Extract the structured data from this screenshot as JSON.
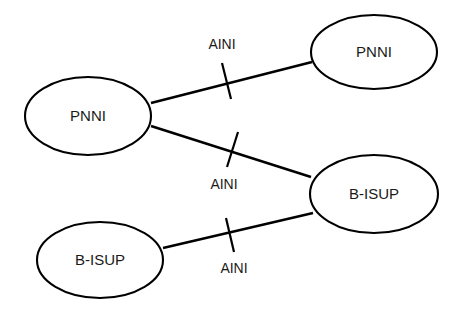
{
  "diagram": {
    "background_color": "#ffffff",
    "line_color": "#000000",
    "text_color": "#1a1a1a",
    "nodes": [
      {
        "id": "pnni-left",
        "label": "PNNI",
        "cx": 88,
        "cy": 116,
        "rx": 63,
        "ry": 39
      },
      {
        "id": "pnni-top-right",
        "label": "PNNI",
        "cx": 374,
        "cy": 52,
        "rx": 63,
        "ry": 37
      },
      {
        "id": "bisup-right",
        "label": "B-ISUP",
        "cx": 374,
        "cy": 194,
        "rx": 64,
        "ry": 39
      },
      {
        "id": "bisup-bottom-left",
        "label": "B-ISUP",
        "cx": 100,
        "cy": 260,
        "rx": 63,
        "ry": 38
      }
    ],
    "links": [
      {
        "id": "link-pnni-left-to-pnni-top-right",
        "label": "AINI",
        "x1": 151,
        "y1": 103,
        "x2": 312,
        "y2": 62,
        "label_x": 222,
        "label_y": 45,
        "tick_x1": 222,
        "tick_y1": 63,
        "tick_x2": 231,
        "tick_y2": 99
      },
      {
        "id": "link-pnni-left-to-bisup-right",
        "label": "AINI",
        "x1": 151,
        "y1": 126,
        "x2": 311,
        "y2": 177,
        "label_x": 224,
        "label_y": 185,
        "tick_x1": 238,
        "tick_y1": 132,
        "tick_x2": 227,
        "tick_y2": 167
      },
      {
        "id": "link-bisup-bottom-left-to-bisup-right",
        "label": "AINI",
        "x1": 163,
        "y1": 248,
        "x2": 313,
        "y2": 213,
        "label_x": 234,
        "label_y": 269,
        "tick_x1": 226,
        "tick_y1": 218,
        "tick_x2": 234,
        "tick_y2": 252
      }
    ]
  }
}
